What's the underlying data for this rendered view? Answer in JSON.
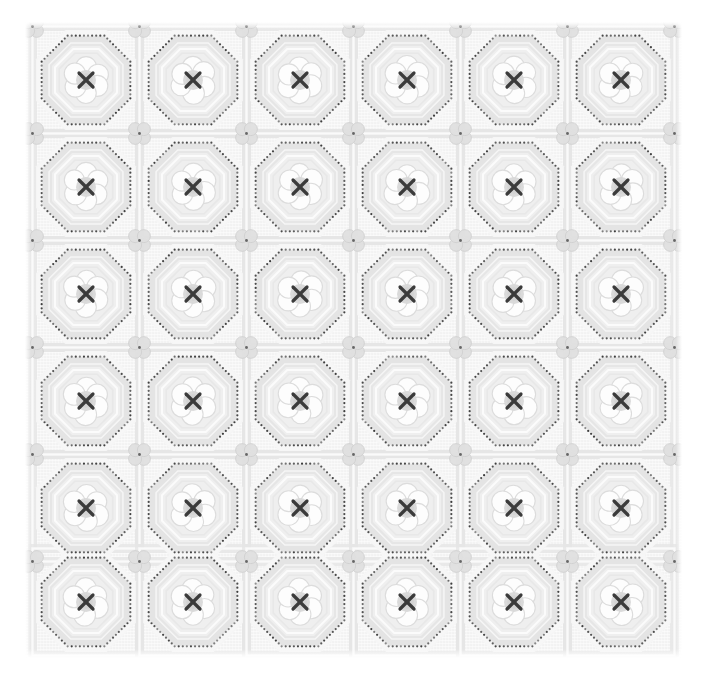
{
  "image": {
    "title": "Lace textile swatch",
    "subject": "white-on-white embroidered cotton lace fabric",
    "width_px": 703,
    "height_px": 688,
    "background_color": "#ffffff"
  },
  "fabric": {
    "name": "octagon-floral-lace-swatch",
    "left_px": 25,
    "top_px": 22,
    "width_px": 657,
    "height_px": 636,
    "ground_color": "#f2f2f2",
    "ground_shadow_color": "#e4e4e4",
    "weave_color": "#ededed",
    "description": "Pale grey woven ground with repeating octagonal medallion grid"
  },
  "grid": {
    "columns": 6,
    "rows": 6,
    "cell_pitch_px": 107,
    "first_center_x_px": 86,
    "first_center_y_px": 80,
    "column_centers_px": [
      86,
      193,
      300,
      407,
      514,
      621
    ],
    "row_centers_px": [
      80,
      187,
      294,
      401,
      508,
      602
    ]
  },
  "motifs": {
    "octagon_frame": {
      "name": "octagon-medallion-frame",
      "outer_radius_px": 52,
      "band_color": "#e2e2e2",
      "band_highlight": "#f7f7f7",
      "dotted_border_color": "#3c3c3c",
      "dot_radius_px": 1.1,
      "dot_count_per_side": 9
    },
    "inner_octagon": {
      "name": "inner-ribbed-octagon",
      "radius_px": 38,
      "rib_color": "#e6e6e6",
      "fill_color": "#efefef"
    },
    "flower": {
      "name": "six-petal-flower",
      "petal_count": 6,
      "petal_color": "#fdfdfd",
      "petal_outline": "#dcdcdc",
      "petal_radius_px": 10.5,
      "petal_orbit_px": 13,
      "center_disc_color": "#d8d8d8",
      "center_disc_radius_px": 10
    },
    "cross_stitch": {
      "name": "x-cross-stitch-mark",
      "glyph": "X",
      "color": "#3a3a3a",
      "arm_length_px": 7,
      "stroke_width_px": 3.2
    },
    "quatrefoil": {
      "name": "quatrefoil-corner-motif",
      "lobe_count": 4,
      "lobe_color": "#e0e0e0",
      "lobe_outline": "#cfcfcf",
      "lobe_radius_px": 6.5,
      "center_dot_color": "#4a4a4a",
      "center_dot_radius_px": 1.4
    },
    "lattice_bar": {
      "name": "lattice-connector-bar",
      "color": "#e6e6e6",
      "highlight": "#fafafa"
    }
  },
  "palette": {
    "white": "#ffffff",
    "near_white": "#fdfdfd",
    "light_grey": "#f2f2f2",
    "mid_grey": "#e2e2e2",
    "shadow_grey": "#d4d4d4",
    "dot_dark": "#3c3c3c",
    "stitch_dark": "#3a3a3a"
  }
}
